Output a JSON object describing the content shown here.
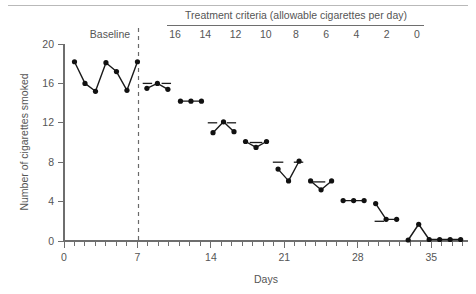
{
  "figure": {
    "top_rule": true,
    "phase_label_baseline": "Baseline",
    "header_title": "Treatment criteria (allowable cigarettes per day)",
    "header_values": [
      "16",
      "14",
      "12",
      "10",
      "8",
      "6",
      "4",
      "2",
      "0"
    ]
  },
  "chart_data": {
    "type": "line",
    "title": "",
    "xlabel": "Days",
    "ylabel": "Number of cigarettes smoked",
    "xlim": [
      0,
      38.5
    ],
    "ylim": [
      0,
      20
    ],
    "xticks": [
      0,
      7,
      14,
      21,
      28,
      35
    ],
    "xtick_labels": [
      "0",
      "7",
      "14",
      "21",
      "28",
      "35"
    ],
    "yticks": [
      0,
      4,
      8,
      12,
      16,
      20
    ],
    "ytick_labels": [
      "0",
      "4",
      "8",
      "12",
      "16",
      "20"
    ],
    "minor_xtick_step": 1,
    "grid": false,
    "legend": null,
    "phase_divider_x": 7.1,
    "series": [
      {
        "name": "Cigarettes smoked per day",
        "x": [
          1,
          2,
          3,
          4,
          5,
          6,
          7,
          7.9,
          8.9,
          9.9,
          11.1,
          12.1,
          13.1,
          14.2,
          15.2,
          16.2,
          17.3,
          18.3,
          19.3,
          20.4,
          21.4,
          22.4,
          23.5,
          24.5,
          25.5,
          26.6,
          27.6,
          28.6,
          29.7,
          30.7,
          31.7,
          32.8,
          33.8,
          34.8,
          35.8,
          36.8,
          37.8
        ],
        "y": [
          18.2,
          16.0,
          15.2,
          18.1,
          17.2,
          15.3,
          18.2,
          15.5,
          16.0,
          15.4,
          14.2,
          14.2,
          14.2,
          11.0,
          12.1,
          11.1,
          10.1,
          9.5,
          10.1,
          7.3,
          6.1,
          8.1,
          6.1,
          5.2,
          6.1,
          4.1,
          4.1,
          4.1,
          3.8,
          2.2,
          2.2,
          0.1,
          1.7,
          0.15,
          0.15,
          0.15,
          0.15
        ]
      }
    ],
    "phases": [
      {
        "label": "Baseline",
        "criterion": null,
        "x_start": 0.3,
        "x_end": 7.1,
        "n_points": 7
      },
      {
        "label": "16",
        "criterion": 16,
        "x_start": 7.4,
        "x_end": 10.4,
        "n_points": 3
      },
      {
        "label": "14",
        "criterion": 14,
        "x_start": 10.6,
        "x_end": 13.6,
        "n_points": 3
      },
      {
        "label": "12",
        "criterion": 12,
        "x_start": 13.7,
        "x_end": 16.7,
        "n_points": 3
      },
      {
        "label": "10",
        "criterion": 10,
        "x_start": 16.8,
        "x_end": 19.8,
        "n_points": 3
      },
      {
        "label": "8",
        "criterion": 8,
        "x_start": 19.9,
        "x_end": 22.9,
        "n_points": 3
      },
      {
        "label": "6",
        "criterion": 6,
        "x_start": 23.0,
        "x_end": 26.0,
        "n_points": 3
      },
      {
        "label": "4",
        "criterion": 4,
        "x_start": 26.1,
        "x_end": 29.1,
        "n_points": 3
      },
      {
        "label": "2",
        "criterion": 2,
        "x_start": 29.2,
        "x_end": 32.2,
        "n_points": 3
      },
      {
        "label": "0",
        "criterion": 0,
        "x_start": 32.3,
        "x_end": 38.3,
        "n_points": 6
      }
    ],
    "criterion_marks": [
      {
        "value": 16,
        "segments": [
          [
            7.5,
            8.4
          ],
          [
            9.3,
            10.2
          ]
        ]
      },
      {
        "value": 12,
        "segments": [
          [
            13.7,
            14.6
          ],
          [
            15.5,
            16.4
          ]
        ]
      },
      {
        "value": 10,
        "segments": [
          [
            17.7,
            18.9
          ]
        ]
      },
      {
        "value": 8,
        "segments": [
          [
            19.9,
            20.9
          ],
          [
            21.9,
            22.8
          ]
        ]
      },
      {
        "value": 6,
        "segments": [
          [
            23.7,
            24.9
          ]
        ]
      },
      {
        "value": 2,
        "segments": [
          [
            29.6,
            30.5
          ]
        ]
      }
    ],
    "annotations": []
  },
  "colors": {
    "data": "#111111",
    "axis": "#6e6e6e",
    "text": "#555555",
    "rule": "#b9b9b9"
  }
}
